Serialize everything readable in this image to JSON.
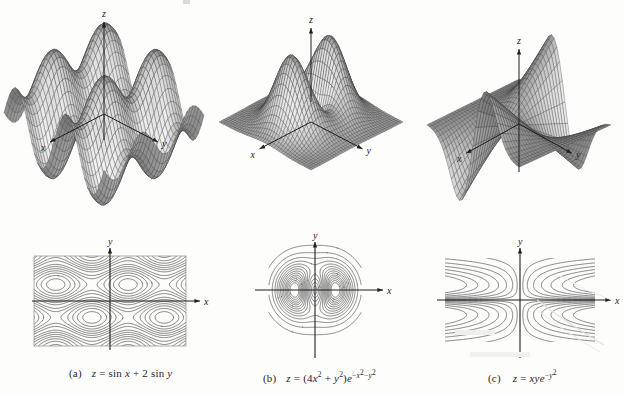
{
  "figure": {
    "background_color": "#fdfdfc",
    "ink_color": "#1c1c1c",
    "mesh_color": "#4a4a4a"
  },
  "panels": [
    {
      "key": "a",
      "caption_label": "(a)",
      "caption_text": "z = sin x + 2 sin y",
      "surface": {
        "axes": [
          {
            "name": "x",
            "label": "x",
            "direction": "lower-left"
          },
          {
            "name": "y",
            "label": "y",
            "direction": "lower-right"
          },
          {
            "name": "z",
            "label": "z",
            "direction": "up"
          }
        ]
      },
      "contour": {
        "axes": [
          {
            "name": "x",
            "label": "x",
            "direction": "right"
          },
          {
            "name": "y",
            "label": "y",
            "direction": "up"
          }
        ],
        "style": "periodic closed loops in rectangular frame",
        "framed": true
      }
    },
    {
      "key": "b",
      "caption_label": "(b)",
      "caption_text": "z = (4x² + y²)e^(−x²−y²)",
      "surface": {
        "axes": [
          {
            "name": "x",
            "label": "x",
            "direction": "lower-left"
          },
          {
            "name": "y",
            "label": "y",
            "direction": "lower-right"
          },
          {
            "name": "z",
            "label": "z",
            "direction": "up"
          }
        ]
      },
      "contour": {
        "axes": [
          {
            "name": "x",
            "label": "x",
            "direction": "right"
          },
          {
            "name": "y",
            "label": "y",
            "direction": "up"
          }
        ],
        "style": "nested ovals with two inner lobes",
        "framed": false
      }
    },
    {
      "key": "c",
      "caption_label": "(c)",
      "caption_text": "z = xye^(−y²)",
      "surface": {
        "axes": [
          {
            "name": "x",
            "label": "x",
            "direction": "lower-left"
          },
          {
            "name": "y",
            "label": "y",
            "direction": "lower-right"
          },
          {
            "name": "z",
            "label": "z",
            "direction": "up"
          }
        ]
      },
      "contour": {
        "axes": [
          {
            "name": "x",
            "label": "x",
            "direction": "right"
          },
          {
            "name": "y",
            "label": "y",
            "direction": "up"
          }
        ],
        "style": "hyperbola-like curves opening away from the y-axis",
        "framed": false
      }
    }
  ],
  "chart_data": [
    {
      "type": "surface",
      "id": "surface-a",
      "title": "z = sin x + 2 sin y",
      "function": "sin(x) + 2*sin(y)",
      "xlabel": "x",
      "ylabel": "y",
      "zlabel": "z",
      "xlim": [
        -6.2,
        6.2
      ],
      "ylim": [
        -6.2,
        6.2
      ],
      "zlim": [
        -3,
        3
      ],
      "grid": "wireframe mesh",
      "legend": "none"
    },
    {
      "type": "contour",
      "id": "contour-a",
      "title": "contour map of z = sin x + 2 sin y",
      "function": "sin(x) + 2*sin(y)",
      "xlabel": "x",
      "ylabel": "y",
      "xlim": [
        -6.2,
        6.2
      ],
      "ylim": [
        -4.2,
        4.2
      ],
      "levels": [
        -2.6,
        -2.2,
        -1.8,
        -1.4,
        -1.0,
        -0.6,
        -0.2,
        0.2,
        0.6,
        1.0,
        1.4,
        1.8,
        2.2,
        2.6
      ],
      "grid": "off",
      "legend": "none"
    },
    {
      "type": "surface",
      "id": "surface-b",
      "title": "z = (4x² + y²)e^(−x²−y²)",
      "function": "(4*x^2 + y^2)*exp(-x^2-y^2)",
      "xlabel": "x",
      "ylabel": "y",
      "zlabel": "z",
      "xlim": [
        -2.6,
        2.6
      ],
      "ylim": [
        -2.6,
        2.6
      ],
      "zlim": [
        0,
        1.5
      ],
      "grid": "wireframe mesh",
      "legend": "none"
    },
    {
      "type": "contour",
      "id": "contour-b",
      "title": "contour map of z = (4x² + y²)e^(−x²−y²)",
      "function": "(4*x^2 + y^2)*exp(-x^2-y^2)",
      "xlabel": "x",
      "ylabel": "y",
      "xlim": [
        -2.2,
        2.2
      ],
      "ylim": [
        -2.2,
        2.2
      ],
      "levels": [
        0.05,
        0.15,
        0.25,
        0.35,
        0.45,
        0.55,
        0.65,
        0.75,
        0.85,
        0.95,
        1.05,
        1.15,
        1.25,
        1.35
      ],
      "grid": "off",
      "legend": "none"
    },
    {
      "type": "surface",
      "id": "surface-c",
      "title": "z = xye^(−y²)",
      "function": "x*y*exp(-y^2)",
      "xlabel": "x",
      "ylabel": "y",
      "zlabel": "z",
      "xlim": [
        -2.6,
        2.6
      ],
      "ylim": [
        -2.6,
        2.6
      ],
      "zlim": [
        -1.2,
        1.2
      ],
      "grid": "wireframe mesh",
      "legend": "none"
    },
    {
      "type": "contour",
      "id": "contour-c",
      "title": "contour map of z = xye^(−y²)",
      "function": "x*y*exp(-y^2)",
      "xlabel": "x",
      "ylabel": "y",
      "xlim": [
        -3.0,
        3.0
      ],
      "ylim": [
        -2.2,
        2.2
      ],
      "levels": [
        -0.9,
        -0.7,
        -0.5,
        -0.35,
        -0.2,
        -0.1,
        0.1,
        0.2,
        0.35,
        0.5,
        0.7,
        0.9
      ],
      "grid": "off",
      "legend": "none"
    }
  ]
}
